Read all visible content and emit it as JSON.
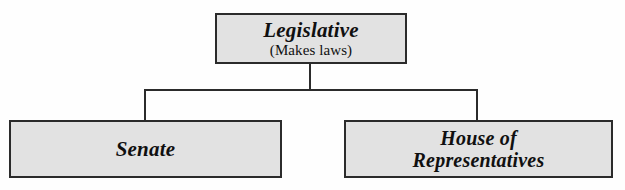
{
  "diagram": {
    "type": "hierarchy-tree",
    "root": {
      "id": "legislative",
      "title": "Legislative",
      "subtitle": "(Makes laws)"
    },
    "children": [
      {
        "id": "senate",
        "title": "Senate"
      },
      {
        "id": "house",
        "title_line_1": "House of",
        "title_line_2": "Representatives"
      }
    ],
    "colors": {
      "box_fill": "#e2e2e2",
      "box_border": "#2b2b2b",
      "connector": "#2b2b2b",
      "text": "#101010",
      "background": "#fefefe"
    }
  }
}
